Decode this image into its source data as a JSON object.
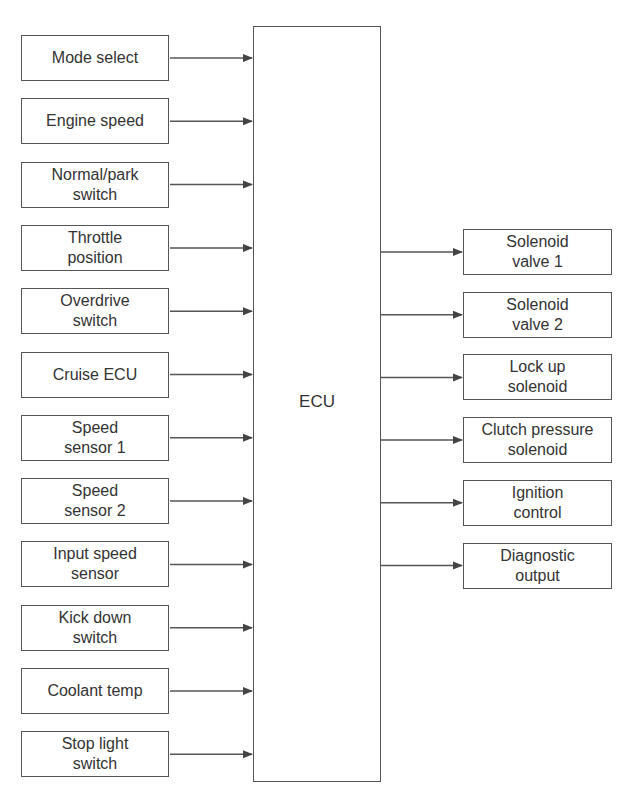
{
  "diagram": {
    "center": {
      "label": "ECU"
    },
    "inputs": [
      {
        "line1": "Mode select",
        "line2": ""
      },
      {
        "line1": "Engine speed",
        "line2": ""
      },
      {
        "line1": "Normal/park",
        "line2": "switch"
      },
      {
        "line1": "Throttle",
        "line2": "position"
      },
      {
        "line1": "Overdrive",
        "line2": "switch"
      },
      {
        "line1": "Cruise ECU",
        "line2": ""
      },
      {
        "line1": "Speed",
        "line2": "sensor 1"
      },
      {
        "line1": "Speed",
        "line2": "sensor 2"
      },
      {
        "line1": "Input speed",
        "line2": "sensor"
      },
      {
        "line1": "Kick down",
        "line2": "switch"
      },
      {
        "line1": "Coolant temp",
        "line2": ""
      },
      {
        "line1": "Stop light",
        "line2": "switch"
      }
    ],
    "outputs": [
      {
        "line1": "Solenoid",
        "line2": "valve 1"
      },
      {
        "line1": "Solenoid",
        "line2": "valve 2"
      },
      {
        "line1": "Lock up",
        "line2": "solenoid"
      },
      {
        "line1": "Clutch pressure",
        "line2": "solenoid"
      },
      {
        "line1": "Ignition",
        "line2": "control"
      },
      {
        "line1": "Diagnostic",
        "line2": "output"
      }
    ],
    "colors": {
      "line": "#555555",
      "text": "#333333",
      "background": "#ffffff"
    }
  }
}
